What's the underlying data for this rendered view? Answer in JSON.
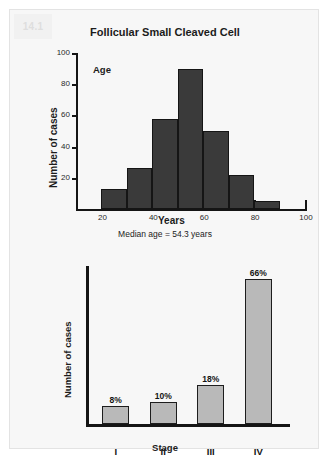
{
  "figure": {
    "number": "14.1"
  },
  "chart_data": [
    {
      "id": "age-histogram",
      "type": "bar",
      "title": "Follicular Small Cleaved Cell",
      "annotation": "Age",
      "caption": "Median age = 54.3 years",
      "xlabel": "Years",
      "ylabel": "Number of cases",
      "xlim": [
        10,
        100
      ],
      "ylim": [
        0,
        100
      ],
      "xticks": [
        "20",
        "40",
        "60",
        "80",
        "100"
      ],
      "xtick_values": [
        20,
        40,
        60,
        80,
        100
      ],
      "yticks": [
        "20",
        "40",
        "60",
        "80",
        "100"
      ],
      "ytick_values": [
        20,
        40,
        60,
        80,
        100
      ],
      "grid": false,
      "bin_width": 10,
      "bins": [
        {
          "x0": 20,
          "x1": 30,
          "value": 13
        },
        {
          "x0": 30,
          "x1": 40,
          "value": 26
        },
        {
          "x0": 40,
          "x1": 50,
          "value": 58
        },
        {
          "x0": 50,
          "x1": 60,
          "value": 90
        },
        {
          "x0": 60,
          "x1": 70,
          "value": 50
        },
        {
          "x0": 70,
          "x1": 80,
          "value": 22
        },
        {
          "x0": 80,
          "x1": 90,
          "value": 5
        }
      ],
      "bar_color": "#3a3a3a"
    },
    {
      "id": "stage-bars",
      "type": "bar",
      "title": "",
      "xlabel": "Stage",
      "ylabel": "Number of cases",
      "categories": [
        "I",
        "II",
        "III",
        "IV"
      ],
      "values": [
        8,
        10,
        18,
        66
      ],
      "value_labels": [
        "8%",
        "10%",
        "18%",
        "66%"
      ],
      "ylim": [
        0,
        72
      ],
      "grid": false,
      "bar_color": "#b9b9b9"
    }
  ]
}
